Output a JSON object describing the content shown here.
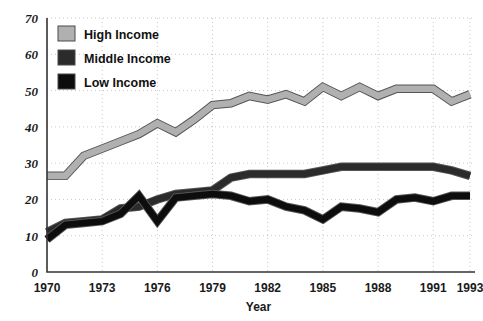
{
  "chart_data": {
    "type": "line",
    "title": "",
    "xlabel": "Year",
    "ylabel": "",
    "xlim": [
      1970,
      1993
    ],
    "ylim": [
      0,
      70
    ],
    "ytick_step": 10,
    "grid": true,
    "legend_position": "top-left",
    "yticks": [
      "70",
      "60",
      "50",
      "40",
      "30",
      "20",
      "10",
      "0"
    ],
    "xticks": [
      "1970",
      "1973",
      "1976",
      "1979",
      "1982",
      "1985",
      "1988",
      "1991",
      "1993"
    ],
    "x": [
      1970,
      1971,
      1972,
      1973,
      1974,
      1975,
      1976,
      1977,
      1978,
      1979,
      1980,
      1981,
      1982,
      1983,
      1984,
      1985,
      1986,
      1987,
      1988,
      1989,
      1990,
      1991,
      1992,
      1993
    ],
    "series": [
      {
        "name": "High Income",
        "color": "#b0b0b0",
        "outline": "#6b6b6b",
        "values": [
          26.5,
          26.5,
          32,
          34,
          36,
          38,
          41,
          38.5,
          42,
          46,
          46.5,
          48.5,
          47.5,
          49,
          47,
          51,
          48.5,
          51,
          48.5,
          50.5,
          50.5,
          50.5,
          47,
          49
        ]
      },
      {
        "name": "Middle Income",
        "color": "#2b2b2b",
        "outline": "#2b2b2b",
        "values": [
          11,
          13.5,
          14,
          14.5,
          17.5,
          18,
          20,
          21.5,
          22,
          22.5,
          26,
          27,
          27,
          27,
          27,
          28,
          29,
          29,
          29,
          29,
          29,
          29,
          28,
          26.5
        ]
      },
      {
        "name": "Low Income",
        "color": "#0d0d0d",
        "outline": "#0d0d0d",
        "values": [
          9,
          13,
          13.5,
          14,
          16,
          21,
          14,
          20.5,
          21,
          21.5,
          21,
          19.5,
          20,
          18,
          17,
          14.5,
          18,
          17.5,
          16.5,
          20,
          20.5,
          19.5,
          21,
          21
        ]
      }
    ]
  },
  "legend": {
    "items": [
      {
        "label": "High Income",
        "swatch": "#b0b0b0"
      },
      {
        "label": "Middle Income",
        "swatch": "#2b2b2b"
      },
      {
        "label": "Low Income",
        "swatch": "#0d0d0d"
      }
    ]
  },
  "axes": {
    "x_title": "Year"
  },
  "colors": {
    "grid": "#c8c8c8",
    "axis": "#333333",
    "text": "#1a1a1a",
    "background": "#ffffff"
  }
}
